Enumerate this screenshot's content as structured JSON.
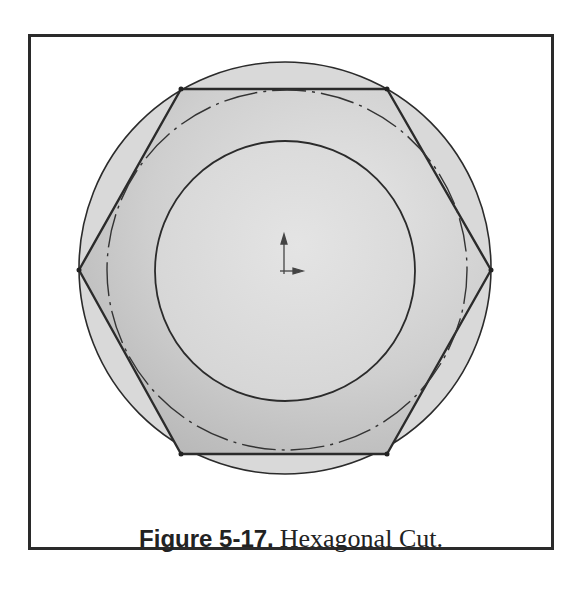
{
  "figure": {
    "number_label": "Figure 5-17.",
    "title": "Hexagonal Cut."
  },
  "drawing": {
    "outer_circle": {
      "cx": 285,
      "cy": 268,
      "r": 206
    },
    "hexagon_points": "181,89 387,89 491,270 387,454 181,454 79,270",
    "construction_circle": {
      "cx": 287,
      "cy": 270,
      "r": 180
    },
    "inner_circle": {
      "cx": 285,
      "cy": 271,
      "r": 130
    },
    "origin": {
      "x": 285,
      "y": 271
    },
    "colors": {
      "line": "#2b2b2b",
      "fill_outer": "#d6d6d6",
      "fill_hex": "#c9c9c9",
      "fill_inner": "#dcdcdc",
      "frame": "#2a2a2a"
    }
  }
}
